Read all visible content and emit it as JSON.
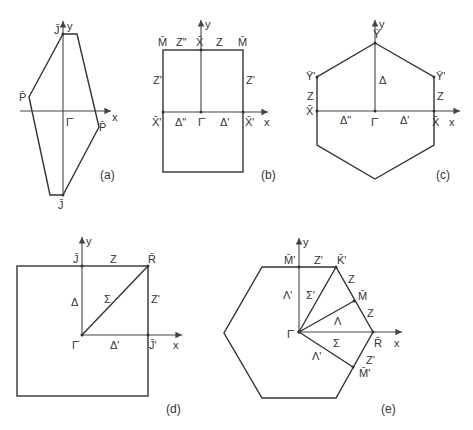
{
  "figure": {
    "panels": [
      {
        "id": "a",
        "caption": "(a)",
        "shape": "distorted hexagon",
        "axis_labels": {
          "x": "x",
          "y": "y"
        },
        "points": {
          "J_top": "J̄",
          "P_left": "P̄",
          "Gamma": "Γ̄",
          "P_right": "P̄",
          "J_bottom": "J̄"
        }
      },
      {
        "id": "b",
        "caption": "(b)",
        "shape": "rectangle",
        "axis_labels": {
          "x": "x",
          "y": "y"
        },
        "points": {
          "M_left": "M̄",
          "Z2": "Z\"",
          "X_top": "X̄",
          "Z": "Z",
          "M_right": "M̄",
          "Z1_left": "Z'",
          "Z1_right": "Z'",
          "X1_left": "X̄'",
          "D2": "Δ\"",
          "Gamma": "Γ̄",
          "D1": "Δ'",
          "X1_right": "X̄'"
        }
      },
      {
        "id": "c",
        "caption": "(c)",
        "shape": "hexagon",
        "axis_labels": {
          "x": "x",
          "y": "y"
        },
        "points": {
          "Y_top": "Ȳ",
          "Y1_left": "Ȳ'",
          "Y1_right": "Ȳ'",
          "Z_left": "Z",
          "Z_right": "Z",
          "X_left": "X̄",
          "X_right": "X̄",
          "Delta": "Δ",
          "D2": "Δ\"",
          "Gamma": "Γ̄",
          "D1": "Δ'"
        }
      },
      {
        "id": "d",
        "caption": "(d)",
        "shape": "square",
        "axis_labels": {
          "x": "x",
          "y": "y"
        },
        "points": {
          "J": "J̄",
          "Z": "Z",
          "R": "R̄",
          "Delta": "Δ",
          "Sigma": "Σ",
          "Z1": "Z'",
          "Gamma": "Γ̄",
          "D1": "Δ'",
          "J1": "J̄'"
        }
      },
      {
        "id": "e",
        "caption": "(e)",
        "shape": "hexagon",
        "axis_labels": {
          "x": "x",
          "y": "y"
        },
        "points": {
          "M1_top": "M̄'",
          "Z1_top": "Z'",
          "K1": "K̄'",
          "Z_upper": "Z",
          "M_mid": "M̄",
          "Z_mid": "Z",
          "L1_upper": "Λ'",
          "S1": "Σ'",
          "Lambda": "Λ",
          "Gamma": "Γ̄",
          "Sigma": "Σ",
          "R": "R̄",
          "L1_lower": "Λ'",
          "Z1_lower": "Z'",
          "M_lower": "M̄'"
        }
      }
    ]
  }
}
